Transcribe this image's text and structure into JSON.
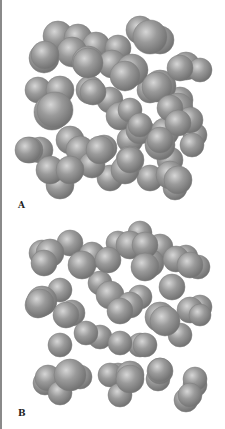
{
  "figure": {
    "sphere_color": "#9a9a9a",
    "sphere_highlight": "#d6d6d6",
    "sphere_shadow": "#6e6e6e",
    "panels": [
      {
        "label": "A"
      },
      {
        "label": "B"
      }
    ]
  }
}
